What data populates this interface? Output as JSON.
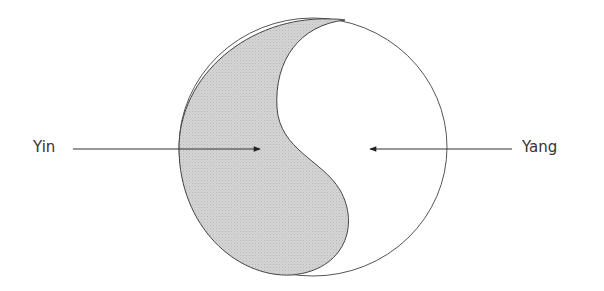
{
  "diagram": {
    "labels": {
      "yin": "Yin",
      "yang": "Yang"
    },
    "colors": {
      "yin_fill": "#cfcfcf",
      "yang_fill": "#ffffff",
      "outline": "#444444",
      "arrow": "#222222",
      "text": "#333333"
    },
    "arrows": [
      {
        "from": "Yin label",
        "points_to": "shaded (yin) region",
        "direction": "right"
      },
      {
        "from": "Yang label",
        "points_to": "white (yang) region",
        "direction": "left"
      }
    ]
  }
}
